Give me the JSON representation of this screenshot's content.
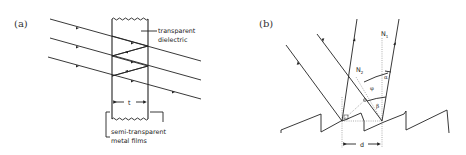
{
  "panel_a": {
    "label": "(a)",
    "annotations": {
      "dielectric_line1": "transparent",
      "dielectric_line2": "dielectric",
      "thickness": "t",
      "films_line1": "semi-transparent",
      "films_line2": "metal films"
    }
  },
  "panel_b": {
    "label": "(b)",
    "annotations": {
      "normal_1": "N",
      "normal_1_sub": "1",
      "normal_2": "N",
      "normal_2_sub": "2",
      "alpha": "α",
      "phi": "φ",
      "beta": "β",
      "spacing": "d"
    }
  },
  "colors": {
    "line": "#222222",
    "dotted": "#777777",
    "background": "#ffffff"
  }
}
